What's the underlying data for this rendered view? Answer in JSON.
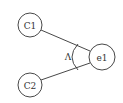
{
  "diagram": {
    "type": "and-decomposition",
    "nodes": [
      {
        "id": "C1",
        "label": "C1",
        "cx": 30,
        "cy": 25,
        "r": 12
      },
      {
        "id": "C2",
        "label": "C2",
        "cx": 30,
        "cy": 85,
        "r": 12
      },
      {
        "id": "e1",
        "label": "e1",
        "cx": 102,
        "cy": 57,
        "r": 13
      }
    ],
    "edges": [
      {
        "from": "C1",
        "to": "e1"
      },
      {
        "from": "C2",
        "to": "e1"
      }
    ],
    "operator": {
      "label": "Λ",
      "meaning": "AND"
    },
    "colors": {
      "stroke": "#333333",
      "background": "#ffffff"
    }
  }
}
